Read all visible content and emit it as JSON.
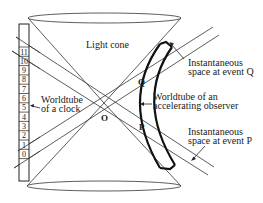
{
  "diagram": {
    "labels": {
      "light_cone": "Light cone",
      "clock_worldtube_line1": "Worldtube",
      "clock_worldtube_line2": "of a clock",
      "observer_worldtube_line1": "Worldtube of an",
      "observer_worldtube_line2": "accelerating observer",
      "space_q_line1": "Instantaneous",
      "space_q_line2": "space at event Q",
      "space_p_line1": "Instantaneous",
      "space_p_line2": "space at event P",
      "origin": "O",
      "event_q": "Q",
      "event_p": "P"
    },
    "clock_ticks": [
      "11",
      "10",
      "9",
      "8",
      "7",
      "6",
      "5",
      "4",
      "3",
      "2",
      "1",
      "0"
    ],
    "colors": {
      "line": "#333333",
      "text": "#1a1a1a",
      "background": "#ffffff"
    }
  }
}
